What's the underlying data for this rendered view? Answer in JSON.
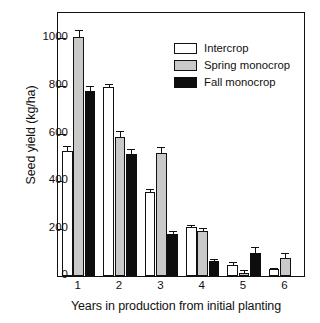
{
  "chart_data": {
    "type": "bar",
    "title": "",
    "xlabel": "Years in production from initial planting",
    "ylabel": "Seed yield (kg/ha)",
    "categories": [
      "1",
      "2",
      "3",
      "4",
      "5",
      "6"
    ],
    "ylim": [
      0,
      1100
    ],
    "yticks": [
      0,
      200,
      400,
      600,
      800,
      1000
    ],
    "ytick_labels": [
      "0",
      "200",
      "400",
      "600",
      "800",
      "1000"
    ],
    "grid": false,
    "legend_position": "upper right inside",
    "series": [
      {
        "name": "Intercrop",
        "color": "#ffffff",
        "values": [
          528,
          795,
          355,
          207,
          48,
          30
        ],
        "errors": [
          22,
          14,
          13,
          9,
          11,
          6
        ]
      },
      {
        "name": "Spring monocrop",
        "color": "#c9c9c9",
        "values": [
          1005,
          587,
          518,
          192,
          15,
          78
        ],
        "errors": [
          30,
          25,
          27,
          13,
          10,
          22
        ]
      },
      {
        "name": "Fall monocrop",
        "color": "#0d0d0d",
        "values": [
          780,
          515,
          178,
          65,
          100,
          null
        ],
        "errors": [
          22,
          20,
          13,
          9,
          25,
          null
        ]
      }
    ]
  },
  "legend": {
    "items": [
      {
        "label": "Intercrop",
        "key": "intercrop"
      },
      {
        "label": "Spring monocrop",
        "key": "spring"
      },
      {
        "label": "Fall monocrop",
        "key": "fall"
      }
    ]
  }
}
